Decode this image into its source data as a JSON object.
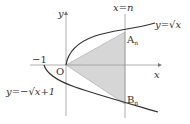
{
  "labels": {
    "y_axis": "y",
    "x_axis": "x",
    "origin": "O",
    "minus_one": "−1",
    "vertical_line": "x=n",
    "upper_curve": "y=√x",
    "lower_curve": "y=−√x+1",
    "point_a": "A",
    "point_a_sub": "n",
    "point_b": "B",
    "point_b_sub": "n"
  },
  "colors": {
    "axis": "#999999",
    "curve": "#333333",
    "shade": "#d4d4d4"
  }
}
